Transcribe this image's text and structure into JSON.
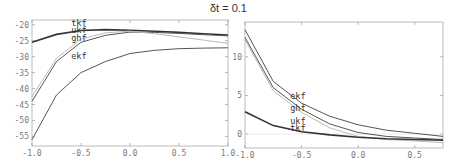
{
  "title": "δt = 0.1",
  "chart_data": [
    {
      "type": "line",
      "title": "δt = 0.1 (left panel)",
      "xlabel": "",
      "ylabel": "",
      "xlim": [
        -1.0,
        1.0
      ],
      "ylim": [
        -58,
        -18.5
      ],
      "x_ticks": [
        "-1.0",
        "-0.5",
        "0.0",
        "0.5",
        "1.0"
      ],
      "y_ticks": [
        "-20",
        "-25",
        "-30",
        "-35",
        "-40",
        "-45",
        "-50",
        "-55"
      ],
      "grid": false,
      "legend": "inline labels",
      "x": [
        -1.0,
        -0.75,
        -0.5,
        -0.25,
        0.0,
        0.25,
        0.5,
        0.75,
        1.0
      ],
      "series": [
        {
          "name": "tkf",
          "color": "#333333",
          "width": 1.6,
          "values": [
            -25.5,
            -23.0,
            -21.8,
            -21.5,
            -21.7,
            -22.0,
            -22.4,
            -22.8,
            -23.2
          ],
          "label_pos": [
            -0.6,
            -20.3
          ]
        },
        {
          "name": "ukf",
          "color": "#555555",
          "width": 1.0,
          "values": [
            -44.0,
            -31.5,
            -25.5,
            -23.3,
            -22.3,
            -22.4,
            -22.7,
            -23.1,
            -23.5
          ],
          "label_pos": [
            -0.6,
            -22.6
          ]
        },
        {
          "name": "ghf",
          "color": "#bbbbbb",
          "width": 1.0,
          "values": [
            -42.5,
            -30.5,
            -24.5,
            -22.5,
            -22.0,
            -22.8,
            -23.8,
            -24.8,
            -25.8
          ],
          "label_pos": [
            -0.6,
            -25.0
          ]
        },
        {
          "name": "ekf",
          "color": "#555555",
          "width": 1.0,
          "values": [
            -56.0,
            -42.0,
            -35.0,
            -31.5,
            -29.0,
            -28.0,
            -27.5,
            -27.3,
            -27.2
          ],
          "label_pos": [
            -0.6,
            -30.8
          ]
        }
      ]
    },
    {
      "type": "line",
      "title": "δt = 0.1 (right panel)",
      "xlabel": "",
      "ylabel": "",
      "xlim": [
        -1.0,
        0.75
      ],
      "ylim": [
        -1.8,
        14.5
      ],
      "x_ticks": [
        "-1.0",
        "-0.5",
        "0.0",
        "0.5"
      ],
      "y_ticks": [
        "10",
        "5",
        "0"
      ],
      "grid": false,
      "legend": "inline labels",
      "x": [
        -1.0,
        -0.75,
        -0.5,
        -0.25,
        0.0,
        0.25,
        0.5,
        0.75
      ],
      "series": [
        {
          "name": "ekf",
          "color": "#555555",
          "width": 1.0,
          "values": [
            13.5,
            6.8,
            4.0,
            2.3,
            1.2,
            0.5,
            0.1,
            -0.3
          ],
          "label_pos": [
            -0.6,
            4.6
          ]
        },
        {
          "name": "ghf",
          "color": "#555555",
          "width": 1.0,
          "values": [
            12.5,
            6.0,
            3.2,
            1.3,
            0.2,
            -0.3,
            -0.5,
            -0.7
          ],
          "label_pos": [
            -0.6,
            3.0
          ]
        },
        {
          "name": "ukf",
          "color": "#bbbbbb",
          "width": 1.0,
          "values": [
            12.2,
            5.6,
            2.8,
            0.8,
            -0.3,
            -0.7,
            -0.9,
            -1.1
          ],
          "label_pos": [
            -0.6,
            1.3
          ]
        },
        {
          "name": "tkf",
          "color": "#333333",
          "width": 1.6,
          "values": [
            2.9,
            1.1,
            0.3,
            -0.1,
            -0.4,
            -0.6,
            -0.7,
            -0.8
          ],
          "label_pos": [
            -0.6,
            0.4
          ]
        }
      ]
    }
  ]
}
